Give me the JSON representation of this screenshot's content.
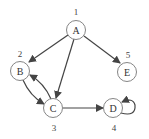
{
  "graph": {
    "nodes": [
      {
        "id": "A",
        "label": "A",
        "index": "1",
        "x": 76,
        "y": 30
      },
      {
        "id": "B",
        "label": "B",
        "index": "2",
        "x": 20,
        "y": 71
      },
      {
        "id": "E",
        "label": "E",
        "index": "5",
        "x": 127,
        "y": 72
      },
      {
        "id": "C",
        "label": "C",
        "index": "3",
        "x": 53,
        "y": 108
      },
      {
        "id": "D",
        "label": "D",
        "index": "4",
        "x": 113,
        "y": 108
      }
    ],
    "edges": [
      {
        "from": "A",
        "to": "B"
      },
      {
        "from": "A",
        "to": "C"
      },
      {
        "from": "A",
        "to": "E"
      },
      {
        "from": "B",
        "to": "C"
      },
      {
        "from": "C",
        "to": "B"
      },
      {
        "from": "C",
        "to": "D"
      },
      {
        "from": "D",
        "to": "D"
      }
    ]
  }
}
